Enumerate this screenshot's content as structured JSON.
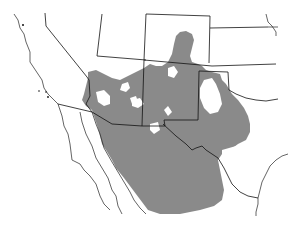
{
  "map": {
    "type": "species-range-map",
    "region": "Southwestern United States and Northern Mexico",
    "background_color": "#ffffff",
    "range_fill_color": "#8a8a8a",
    "boundary_color": "#111111",
    "legend": null,
    "labels": []
  }
}
